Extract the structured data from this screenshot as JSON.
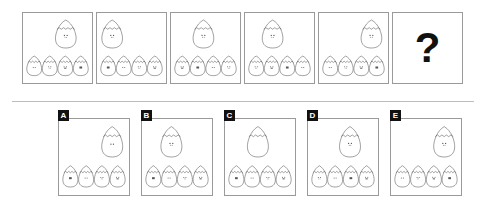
{
  "puzzle": {
    "type": "visual-sequence-reasoning",
    "title": "",
    "question_mark": "?",
    "egg_motif": "cracked-egg-with-face",
    "colors": {
      "outline": "#555555",
      "panel_border": "#9a9a9a",
      "label_background": "#111111",
      "label_text": "#ffffff",
      "question_mark": "#111111",
      "divider": "#bdbdbd",
      "background": "#ffffff"
    },
    "sequence_description": "A large cracked egg changes horizontal position across the panels while a row of four small cracked eggs sits below.",
    "panels": [
      {
        "index": 1,
        "name": "panel-1",
        "big_egg": {
          "present": true,
          "position": "right-center",
          "x_ratio": 0.62,
          "has_face": true,
          "face": "eyes-mouth"
        },
        "small_eggs": [
          {
            "face": "eyes"
          },
          {
            "face": "eyes-mouth"
          },
          {
            "face": "eyes-mouth-wide"
          },
          {
            "face": "eyes-dots"
          }
        ]
      },
      {
        "index": 2,
        "name": "panel-2",
        "big_egg": {
          "present": true,
          "position": "left",
          "x_ratio": 0.22,
          "has_face": true,
          "face": "eyes-mouth"
        },
        "small_eggs": [
          {
            "face": "eyes-dots"
          },
          {
            "face": "eyes"
          },
          {
            "face": "eyes-mouth"
          },
          {
            "face": "eyes-mouth-wide"
          }
        ]
      },
      {
        "index": 3,
        "name": "panel-3",
        "big_egg": {
          "present": true,
          "position": "center",
          "x_ratio": 0.47,
          "has_face": true,
          "face": "eyes-mouth"
        },
        "small_eggs": [
          {
            "face": "eyes-mouth-wide"
          },
          {
            "face": "eyes-dots"
          },
          {
            "face": "eyes"
          },
          {
            "face": "eyes-mouth"
          }
        ]
      },
      {
        "index": 4,
        "name": "panel-4",
        "big_egg": {
          "present": true,
          "position": "center-left",
          "x_ratio": 0.4,
          "has_face": true,
          "face": "eyes-mouth"
        },
        "small_eggs": [
          {
            "face": "eyes-mouth"
          },
          {
            "face": "eyes-mouth-wide"
          },
          {
            "face": "eyes-dots"
          },
          {
            "face": "eyes"
          }
        ]
      },
      {
        "index": 5,
        "name": "panel-5",
        "big_egg": {
          "present": true,
          "position": "right",
          "x_ratio": 0.76,
          "has_face": true,
          "face": "eyes-mouth"
        },
        "small_eggs": [
          {
            "face": "eyes"
          },
          {
            "face": "eyes-mouth"
          },
          {
            "face": "eyes-mouth-wide"
          },
          {
            "face": "eyes-dots"
          }
        ]
      },
      {
        "index": 6,
        "name": "panel-question",
        "is_question": true,
        "big_egg": {
          "present": false
        },
        "small_eggs": []
      }
    ],
    "options": [
      {
        "label": "A",
        "name": "option-a",
        "big_egg": {
          "present": true,
          "position": "right",
          "x_ratio": 0.76,
          "has_face": true,
          "face": "eyes"
        },
        "small_eggs": [
          {
            "face": "eyes-dots"
          },
          {
            "face": "eyes"
          },
          {
            "face": "eyes-mouth"
          },
          {
            "face": "eyes-mouth-wide"
          }
        ]
      },
      {
        "label": "B",
        "name": "option-b",
        "big_egg": {
          "present": true,
          "position": "center-left",
          "x_ratio": 0.42,
          "has_face": true,
          "face": "eyes-mouth"
        },
        "small_eggs": [
          {
            "face": "eyes-dots"
          },
          {
            "face": "eyes"
          },
          {
            "face": "eyes-mouth"
          },
          {
            "face": "eyes-mouth-wide"
          }
        ]
      },
      {
        "label": "C",
        "name": "option-c",
        "big_egg": {
          "present": true,
          "position": "center",
          "x_ratio": 0.47,
          "has_face": false,
          "face": "none"
        },
        "small_eggs": [
          {
            "face": "eyes-dots"
          },
          {
            "face": "eyes"
          },
          {
            "face": "eyes-mouth"
          },
          {
            "face": "eyes-mouth-wide"
          }
        ]
      },
      {
        "label": "D",
        "name": "option-d",
        "big_egg": {
          "present": true,
          "position": "center-right",
          "x_ratio": 0.6,
          "has_face": true,
          "face": "eyes-mouth"
        },
        "small_eggs": [
          {
            "face": "eyes-mouth"
          },
          {
            "face": "eyes"
          },
          {
            "face": "eyes-dots"
          },
          {
            "face": "eyes-mouth-wide"
          }
        ]
      },
      {
        "label": "E",
        "name": "option-e",
        "big_egg": {
          "present": true,
          "position": "right",
          "x_ratio": 0.76,
          "has_face": true,
          "face": "eyes-mouth"
        },
        "small_eggs": [
          {
            "face": "eyes"
          },
          {
            "face": "eyes-mouth"
          },
          {
            "face": "eyes-mouth-wide"
          },
          {
            "face": "eyes-dots"
          }
        ]
      }
    ]
  }
}
